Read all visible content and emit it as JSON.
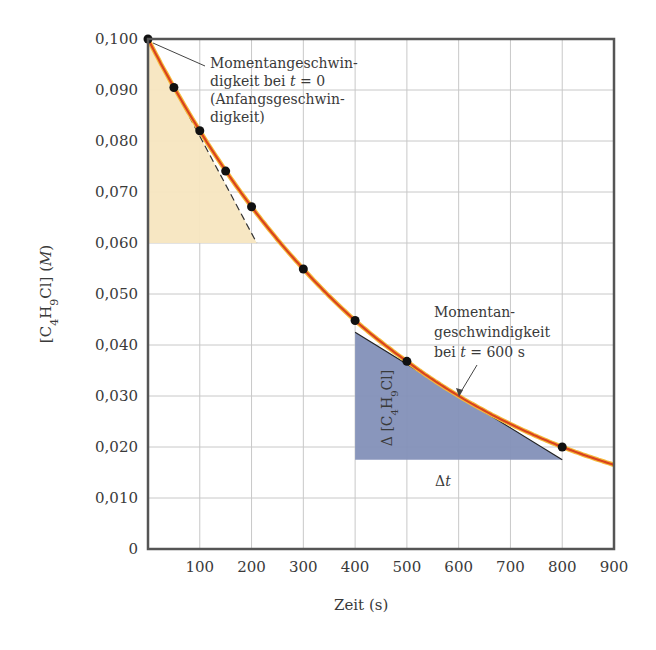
{
  "chart_data": {
    "type": "line",
    "title": "",
    "xlabel": "Zeit (s)",
    "ylabel": "[C4H9Cl] (M)",
    "xlim": [
      0,
      900
    ],
    "ylim": [
      0,
      0.1
    ],
    "grid": true,
    "x_ticks": [
      "100",
      "200",
      "300",
      "400",
      "500",
      "600",
      "700",
      "800",
      "900"
    ],
    "y_ticks": [
      "0",
      "0,010",
      "0,020",
      "0,030",
      "0,040",
      "0,050",
      "0,060",
      "0,070",
      "0,080",
      "0,090",
      "0,100"
    ],
    "series": [
      {
        "name": "[C4H9Cl] measured",
        "style": "points",
        "x": [
          0,
          50,
          100,
          150,
          200,
          300,
          400,
          500,
          800
        ],
        "values": [
          0.1,
          0.0905,
          0.082,
          0.0741,
          0.0671,
          0.0549,
          0.0448,
          0.0368,
          0.02
        ]
      },
      {
        "name": "fitted curve",
        "style": "line",
        "color": "#d9431e",
        "x": [
          0,
          100,
          200,
          300,
          400,
          500,
          600,
          700,
          800,
          900
        ],
        "values": [
          0.1,
          0.082,
          0.0671,
          0.0549,
          0.0448,
          0.0368,
          0.03,
          0.0245,
          0.02,
          0.0165
        ]
      }
    ],
    "tangents": [
      {
        "at_t": 0,
        "style": "dashed",
        "from": [
          0,
          0.1
        ],
        "to": [
          210,
          0.06
        ],
        "fill_color": "#f7e6c0",
        "triangle": [
          [
            0,
            0.1
          ],
          [
            0,
            0.06
          ],
          [
            210,
            0.06
          ]
        ]
      },
      {
        "at_t": 600,
        "style": "solid",
        "from": [
          400,
          0.0425
        ],
        "to": [
          800,
          0.0175
        ],
        "fill_color": "#8390b8",
        "triangle": [
          [
            400,
            0.0425
          ],
          [
            400,
            0.0175
          ],
          [
            800,
            0.0175
          ]
        ]
      }
    ],
    "annotations": [
      {
        "text": [
          "Momentangeschwin-",
          "digkeit bei t = 0",
          "(Anfangsgeschwin-",
          "digkeit)"
        ],
        "points_to": [
          0,
          0.1
        ]
      },
      {
        "text": [
          "Momentan-",
          "geschwindigkeit",
          "bei t = 600 s"
        ],
        "points_to": [
          600,
          0.03
        ]
      },
      {
        "text": "Δ [C4H9Cl]",
        "orientation": "vertical"
      },
      {
        "text": "Δt"
      }
    ]
  },
  "labels": {
    "x_axis": "Zeit (s)",
    "y_axis_prefix": "[C",
    "y_axis_sub1": "4",
    "y_axis_mid": "H",
    "y_axis_sub2": "9",
    "y_axis_suffix": "Cl] (",
    "y_axis_unit": "M",
    "y_axis_close": ")",
    "ann1": [
      "Momentangeschwin-",
      "digkeit bei ",
      "t",
      " = 0",
      "(Anfangsgeschwin-",
      "digkeit)"
    ],
    "ann2": [
      "Momentan-",
      "geschwindigkeit",
      "bei ",
      "t",
      " = 600 s"
    ],
    "delta_conc_prefix": "Δ [C",
    "delta_conc_sub1": "4",
    "delta_conc_mid": "H",
    "delta_conc_sub2": "9",
    "delta_conc_suffix": "Cl]",
    "delta_t_prefix": "Δ",
    "delta_t_var": "t"
  }
}
